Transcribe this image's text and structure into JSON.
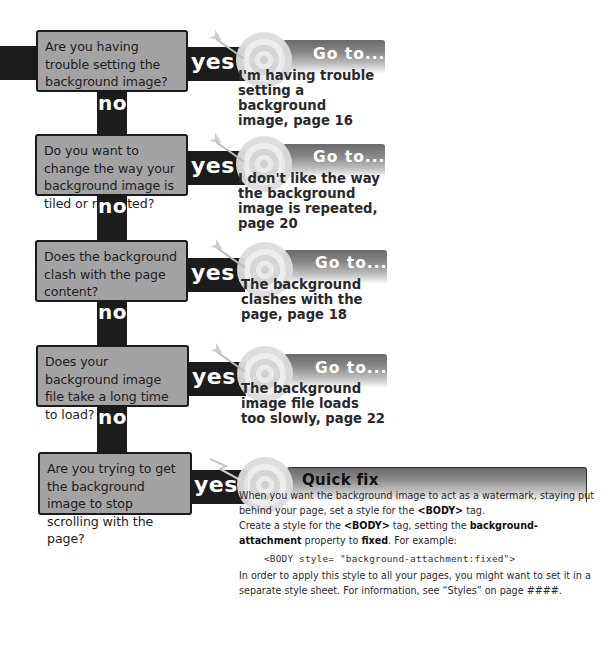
{
  "flowchart": {
    "steps": [
      {
        "question": "Are you having trouble setting the background image?",
        "yes_label": "yes",
        "no_label": "no",
        "result_header": "Go to...",
        "result_text": "I'm having trouble setting a background image, page 16"
      },
      {
        "question": "Do you want to change the way your background image is tiled or repeated?",
        "yes_label": "yes",
        "no_label": "no",
        "result_header": "Go to...",
        "result_text": "I don't like the way the background image is repeated, page 20"
      },
      {
        "question": "Does the background clash with the page content?",
        "yes_label": "yes",
        "no_label": "no",
        "result_header": "Go to...",
        "result_text": "The background clashes with the page, page 18"
      },
      {
        "question": "Does your background image file take a long time to load?",
        "yes_label": "yes",
        "no_label": "no",
        "result_header": "Go to...",
        "result_text": "The background image file loads too slowly, page 22"
      },
      {
        "question": "Are you trying to get the background image to stop scrolling with the page?",
        "yes_label": "yes"
      }
    ],
    "quick_fix": {
      "header": "Quick fix",
      "para1_a": "When you want the background image to act as a watermark, staying put behind your page, set a style for the ",
      "para1_tag": "<BODY>",
      "para1_b": " tag.",
      "para2_a": "Create a style for the ",
      "para2_tag": "<BODY>",
      "para2_b": " tag, setting the ",
      "para2_prop": "background-attachment",
      "para2_c": " property to ",
      "para2_val": "fixed",
      "para2_d": ". For example:",
      "code": "<BODY style= \"background-attachment:fixed\">",
      "para3": "In order to apply this style to all your pages, you might want to set it in a separate style sheet. For information, see “Styles” on page ####."
    }
  }
}
